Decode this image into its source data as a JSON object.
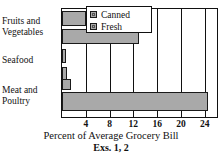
{
  "chart_data": {
    "type": "bar",
    "orientation": "horizontal",
    "title": "",
    "xlabel": "Percent of Average Grocery Bill",
    "ylabel": "",
    "categories": [
      "Fruits and Vegetables",
      "Seafood",
      "Meat and Poultry"
    ],
    "series": [
      {
        "name": "Canned",
        "values": [
          4,
          0.7,
          1.5
        ],
        "color": "#a9a9a9"
      },
      {
        "name": "Fresh",
        "values": [
          13,
          0.8,
          24.5
        ],
        "color": "#a9a9a9"
      }
    ],
    "xlim": [
      0,
      26
    ],
    "xticks": [
      4,
      8,
      12,
      16,
      20,
      24
    ],
    "xticklabels": [
      "4",
      "8",
      "12",
      "16",
      "20",
      "24"
    ],
    "grid": "vertical",
    "legend_position": "top-right",
    "caption": "Exs. 1, 2"
  },
  "category_labels": [
    {
      "line1": "Fruits and",
      "line2": "Vegetables"
    },
    {
      "line1": "Seafood",
      "line2": ""
    },
    {
      "line1": "Meat and",
      "line2": "Poultry"
    }
  ],
  "legend": {
    "items": [
      {
        "label": "Canned",
        "swatch": "gray-square-swatch"
      },
      {
        "label": "Fresh",
        "swatch": "gray-square-swatch"
      }
    ]
  },
  "axis": {
    "xticklabels": [
      "4",
      "8",
      "12",
      "16",
      "20",
      "24"
    ],
    "xlabel": "Percent of Average Grocery Bill"
  },
  "caption": "Exs. 1, 2",
  "colors": {
    "bar_fill": "#a9a9a9",
    "bar_border": "#1a1a1a",
    "frame": "#111111",
    "background": "#ffffff"
  }
}
